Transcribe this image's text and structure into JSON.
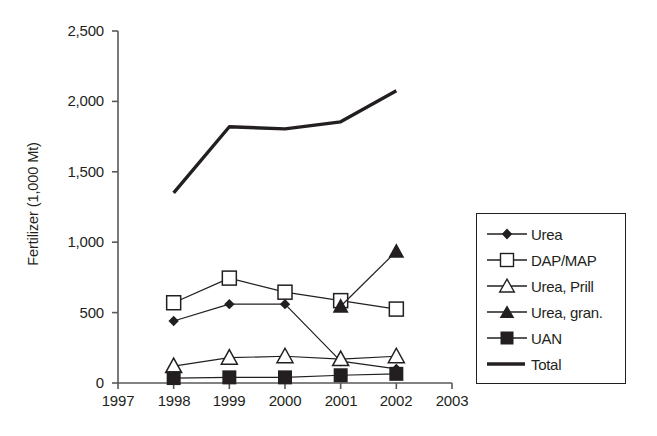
{
  "chart_data": {
    "type": "line",
    "title": "",
    "xlabel": "",
    "ylabel": "Fertilizer (1,000 Mt)",
    "x": [
      1998,
      1999,
      2000,
      2001,
      2002
    ],
    "xlim": [
      1997,
      2003
    ],
    "ylim": [
      0,
      2500
    ],
    "xticks": [
      "1997",
      "1998",
      "1999",
      "2000",
      "2001",
      "2002",
      "2003"
    ],
    "yticks": [
      "0",
      "500",
      "1,000",
      "1,500",
      "2,000",
      "2,500"
    ],
    "ytick_values": [
      0,
      500,
      1000,
      1500,
      2000,
      2500
    ],
    "grid": false,
    "legend_position": "right",
    "series": [
      {
        "name": "Urea",
        "marker": "filled-diamond",
        "values": [
          440,
          560,
          560,
          155,
          100
        ]
      },
      {
        "name": "DAP/MAP",
        "marker": "open-square",
        "values": [
          570,
          745,
          645,
          585,
          525
        ]
      },
      {
        "name": "Urea, Prill",
        "marker": "open-triangle",
        "values": [
          120,
          180,
          190,
          170,
          190
        ]
      },
      {
        "name": "Urea, gran.",
        "marker": "filled-triangle",
        "values": [
          null,
          null,
          null,
          545,
          935
        ]
      },
      {
        "name": "UAN",
        "marker": "filled-square",
        "values": [
          35,
          40,
          40,
          55,
          65
        ]
      },
      {
        "name": "Total",
        "marker": "thick-line",
        "values": [
          1350,
          1820,
          1805,
          1855,
          2075
        ]
      }
    ]
  },
  "legend": {
    "items": [
      {
        "label": "Urea",
        "marker": "filled-diamond-icon"
      },
      {
        "label": "DAP/MAP",
        "marker": "open-square-icon"
      },
      {
        "label": "Urea, Prill",
        "marker": "open-triangle-icon"
      },
      {
        "label": "Urea, gran.",
        "marker": "filled-triangle-icon"
      },
      {
        "label": "UAN",
        "marker": "filled-square-icon"
      },
      {
        "label": "Total",
        "marker": "thick-line-icon"
      }
    ]
  },
  "colors": {
    "ink": "#231f20",
    "background": "#ffffff"
  }
}
